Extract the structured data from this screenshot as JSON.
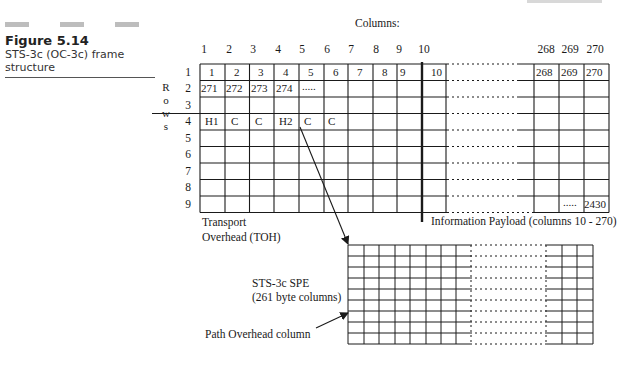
{
  "figure": {
    "number": "Figure 5.14",
    "caption": "STS-3c (OC-3c) frame structure"
  },
  "main_frame": {
    "columns_heading": "Columns:",
    "column_labels": [
      "1",
      "2",
      "3",
      "4",
      "5",
      "6",
      "7",
      "8",
      "9",
      "10",
      "268",
      "269",
      "270"
    ],
    "rows_heading_letters": [
      "R",
      "o",
      "w",
      "s"
    ],
    "row_labels": [
      "1",
      "2",
      "3",
      "4",
      "5",
      "6",
      "7",
      "8",
      "9"
    ],
    "row1_cells": [
      "1",
      "2",
      "3",
      "4",
      "5",
      "6",
      "7",
      "8",
      "9",
      "10",
      "268",
      "269",
      "270"
    ],
    "row2_cells": [
      "271",
      "272",
      "273",
      "274",
      "....."
    ],
    "row4_cells": [
      "H1",
      "C",
      "C",
      "H2",
      "C",
      "C"
    ],
    "last_row_cells": [
      ".....",
      "2430"
    ],
    "toh_label_line1": "Transport",
    "toh_label_line2": "Overhead (TOH)",
    "payload_label": "Information Payload (columns 10 - 270)"
  },
  "spe": {
    "label_line1": "STS-3c SPE",
    "label_line2": "(261 byte columns)",
    "path_overhead_label": "Path Overhead column"
  },
  "colors": {
    "line": "#1a1a1a",
    "accent_bar": "#bdbdbd"
  }
}
